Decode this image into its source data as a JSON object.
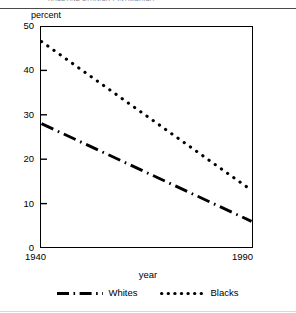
{
  "header": {
    "ghost_text": "RACE AND ETHNICITY IN AMERICA",
    "visible": true
  },
  "chart_data": {
    "type": "line",
    "title": "",
    "xlabel": "year",
    "ylabel": "percent",
    "xlim": [
      1940,
      1990
    ],
    "ylim": [
      0,
      50
    ],
    "ytick_labels": [
      "0",
      "10",
      "20",
      "30",
      "40",
      "50"
    ],
    "ytick_values": [
      0,
      10,
      20,
      30,
      40,
      50
    ],
    "xtick_labels": [
      "1940",
      "1990"
    ],
    "xtick_values": [
      1940,
      1990
    ],
    "grid": false,
    "legend_position": "bottom",
    "series": [
      {
        "name": "Whites",
        "style": "dash-dot",
        "color": "#000000",
        "x": [
          1940,
          1990
        ],
        "values": [
          28,
          6
        ]
      },
      {
        "name": "Blacks",
        "style": "dotted",
        "color": "#000000",
        "x": [
          1940,
          1990
        ],
        "values": [
          46.5,
          13
        ]
      }
    ]
  },
  "legend": {
    "entries": [
      {
        "label": "Whites",
        "style": "dash-dot"
      },
      {
        "label": "Blacks",
        "style": "dotted"
      }
    ]
  }
}
